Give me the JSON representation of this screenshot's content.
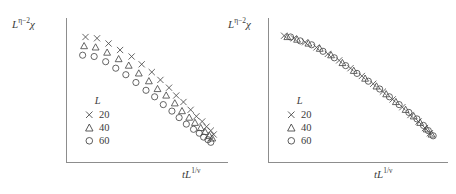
{
  "figure": {
    "panels": [
      {
        "id": "left",
        "role": "uncollapsed-data",
        "ylabel_base": "L",
        "ylabel_exp": "η−2",
        "ylabel_var": "χ",
        "xlabel_pre": "t",
        "xlabel_base": "L",
        "xlabel_exp": "1/ν",
        "legend_title": "L",
        "legend": [
          {
            "marker": "cross",
            "label": "20"
          },
          {
            "marker": "triangle",
            "label": "40"
          },
          {
            "marker": "circle",
            "label": "60"
          }
        ]
      },
      {
        "id": "right",
        "role": "collapsed-data",
        "ylabel_base": "L",
        "ylabel_exp": "η−2",
        "ylabel_var": "χ",
        "xlabel_pre": "t",
        "xlabel_base": "L",
        "xlabel_exp": "1/ν",
        "legend_title": "L",
        "legend": [
          {
            "marker": "cross",
            "label": "20"
          },
          {
            "marker": "triangle",
            "label": "40"
          },
          {
            "marker": "circle",
            "label": "60"
          }
        ]
      }
    ]
  },
  "chart_data": [
    {
      "type": "scatter",
      "panel": "left",
      "title": "",
      "xlabel": "tL^(1/ν)",
      "ylabel": "L^(η−2)χ",
      "xlim": [
        0,
        100
      ],
      "ylim": [
        0,
        100
      ],
      "grid": false,
      "axis_ticks": false,
      "legend_position": "lower-left-inside",
      "note": "three system sizes do not collapse; curves are vertically offset and converge at large x",
      "series": [
        {
          "name": "20",
          "marker": "cross",
          "points": [
            [
              8,
              90
            ],
            [
              16,
              89
            ],
            [
              24,
              85
            ],
            [
              32,
              80
            ],
            [
              40,
              75
            ],
            [
              47,
              69
            ],
            [
              54,
              63
            ],
            [
              60,
              57
            ],
            [
              66,
              51
            ],
            [
              71,
              45
            ],
            [
              76,
              40
            ],
            [
              81,
              34
            ],
            [
              85,
              29
            ],
            [
              89,
              25
            ],
            [
              92,
              21
            ],
            [
              95,
              18
            ],
            [
              97,
              15
            ]
          ]
        },
        {
          "name": "40",
          "marker": "triangle",
          "points": [
            [
              7,
              83
            ],
            [
              15,
              82
            ],
            [
              23,
              78
            ],
            [
              31,
              73
            ],
            [
              38,
              68
            ],
            [
              45,
              62
            ],
            [
              52,
              56
            ],
            [
              58,
              50
            ],
            [
              64,
              45
            ],
            [
              70,
              39
            ],
            [
              75,
              33
            ],
            [
              80,
              28
            ],
            [
              84,
              24
            ],
            [
              88,
              20
            ],
            [
              91,
              17
            ],
            [
              94,
              14
            ],
            [
              96,
              12
            ]
          ]
        },
        {
          "name": "60",
          "marker": "circle",
          "points": [
            [
              6,
              76
            ],
            [
              14,
              75
            ],
            [
              22,
              71
            ],
            [
              29,
              66
            ],
            [
              36,
              61
            ],
            [
              43,
              55
            ],
            [
              50,
              49
            ],
            [
              56,
              44
            ],
            [
              62,
              38
            ],
            [
              68,
              33
            ],
            [
              73,
              28
            ],
            [
              78,
              23
            ],
            [
              83,
              19
            ],
            [
              87,
              16
            ],
            [
              90,
              13
            ],
            [
              93,
              11
            ],
            [
              95,
              9
            ]
          ]
        }
      ]
    },
    {
      "type": "scatter",
      "panel": "right",
      "title": "",
      "xlabel": "tL^(1/ν)",
      "ylabel": "L^(η−2)χ",
      "xlim": [
        0,
        100
      ],
      "ylim": [
        0,
        100
      ],
      "grid": false,
      "axis_ticks": false,
      "legend_position": "lower-left-inside",
      "note": "all three system sizes collapse onto a single universal scaling curve",
      "series": [
        {
          "name": "20",
          "marker": "cross",
          "points": [
            [
              5,
              91
            ],
            [
              11,
              89
            ],
            [
              18,
              86
            ],
            [
              25,
              82
            ],
            [
              32,
              77
            ],
            [
              39,
              72
            ],
            [
              46,
              66
            ],
            [
              53,
              60
            ],
            [
              60,
              54
            ],
            [
              66,
              48
            ],
            [
              72,
              42
            ],
            [
              78,
              36
            ],
            [
              83,
              30
            ],
            [
              88,
              25
            ],
            [
              92,
              20
            ],
            [
              95,
              16
            ]
          ]
        },
        {
          "name": "40",
          "marker": "triangle",
          "points": [
            [
              7,
              90
            ],
            [
              13,
              88
            ],
            [
              20,
              85
            ],
            [
              27,
              81
            ],
            [
              34,
              76
            ],
            [
              41,
              70
            ],
            [
              48,
              64
            ],
            [
              55,
              58
            ],
            [
              62,
              52
            ],
            [
              68,
              46
            ],
            [
              74,
              40
            ],
            [
              80,
              34
            ],
            [
              85,
              29
            ],
            [
              89,
              24
            ],
            [
              93,
              19
            ],
            [
              96,
              15
            ]
          ]
        },
        {
          "name": "60",
          "marker": "circle",
          "points": [
            [
              9,
              90
            ],
            [
              15,
              87
            ],
            [
              22,
              84
            ],
            [
              29,
              79
            ],
            [
              36,
              74
            ],
            [
              43,
              68
            ],
            [
              50,
              62
            ],
            [
              57,
              56
            ],
            [
              64,
              50
            ],
            [
              70,
              44
            ],
            [
              76,
              38
            ],
            [
              82,
              32
            ],
            [
              87,
              27
            ],
            [
              91,
              22
            ],
            [
              94,
              18
            ],
            [
              97,
              14
            ]
          ]
        }
      ]
    }
  ]
}
